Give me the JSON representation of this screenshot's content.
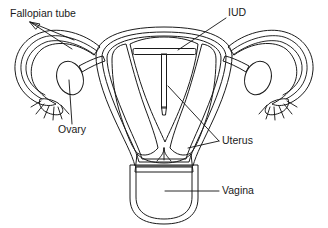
{
  "figure": {
    "type": "anatomical-cross-section-diagram",
    "width": 328,
    "height": 228,
    "background_color": "#ffffff",
    "line_color": "#1b1b1b"
  },
  "labels": [
    {
      "key": "fallopian_tube",
      "text": "Fallopian tube",
      "x": 10,
      "y": 14,
      "anchor": "start",
      "leaders": 2,
      "points_to": "left and right fallopian tubes"
    },
    {
      "key": "iud",
      "text": "IUD",
      "x": 228,
      "y": 13,
      "anchor": "start",
      "leaders": 1,
      "points_to": "T-shaped device in uterine cavity"
    },
    {
      "key": "ovary",
      "text": "Ovary",
      "x": 72,
      "y": 130,
      "anchor": "middle",
      "leaders": 1,
      "points_to": "left ovary"
    },
    {
      "key": "uterus",
      "text": "Uterus",
      "x": 222,
      "y": 141,
      "anchor": "start",
      "leaders": 2,
      "points_to": "uterine cavity and uterine wall"
    },
    {
      "key": "vagina",
      "text": "Vagina",
      "x": 222,
      "y": 191,
      "anchor": "start",
      "leaders": 1,
      "points_to": "vaginal canal"
    }
  ],
  "structures": [
    {
      "key": "uterine-body",
      "name": "Uterus body (myometrium)",
      "fill": "#c9c9c9"
    },
    {
      "key": "uterine-cavity",
      "name": "Uterine cavity / endometrium",
      "fill": "#6d6d6d"
    },
    {
      "key": "serosa",
      "name": "Outer serosal layer",
      "fill": "#8e8e8e"
    },
    {
      "key": "fallopian-tube",
      "name": "Fallopian tube",
      "fill": "#a6a6a6"
    },
    {
      "key": "fimbriae",
      "name": "Fimbriae",
      "fill": "#b0b0b0"
    },
    {
      "key": "ovary",
      "name": "Ovary",
      "fill": "#b4b4b4"
    },
    {
      "key": "cervix",
      "name": "Cervix",
      "fill": "#cfcfcf"
    },
    {
      "key": "vagina",
      "name": "Vaginal canal",
      "fill": "#7a7a7a"
    },
    {
      "key": "iud-device",
      "name": "IUD (T-shaped device)",
      "fill": "#ffffff"
    }
  ],
  "palette": {
    "white": "#ffffff",
    "outline": "#1b1b1b",
    "light_gray": "#c9c9c9",
    "mid_gray": "#a6a6a6",
    "dark_gray": "#6d6d6d",
    "vagina_gray": "#7a7a7a",
    "serosa_gray": "#8e8e8e",
    "cervix_gray": "#cfcfcf"
  }
}
